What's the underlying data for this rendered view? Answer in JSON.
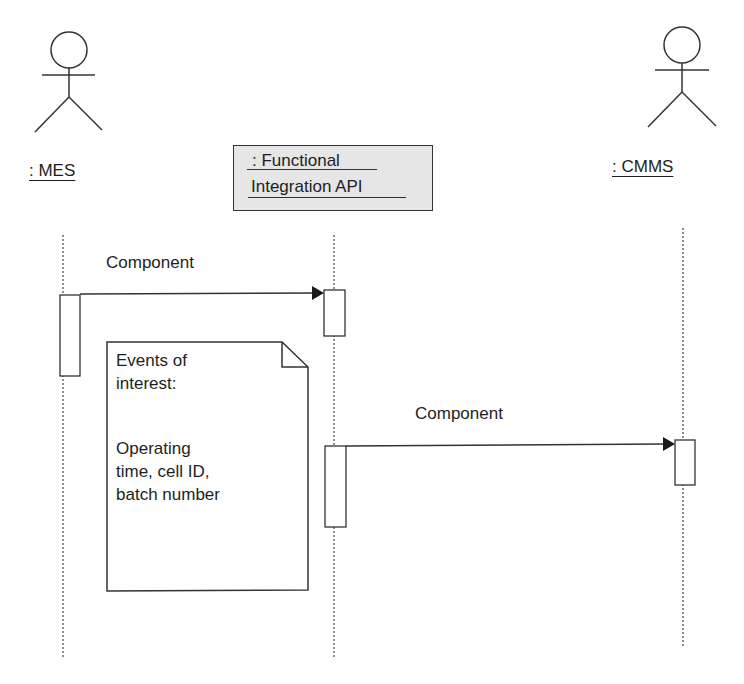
{
  "diagram": {
    "type": "UML sequence diagram",
    "participants": [
      {
        "id": "mes",
        "kind": "actor",
        "label": ": MES"
      },
      {
        "id": "api",
        "kind": "object",
        "label_line1": ": Functional",
        "label_line2": "Integration API"
      },
      {
        "id": "cmms",
        "kind": "actor",
        "label": ": CMMS"
      }
    ],
    "messages": [
      {
        "from": "mes",
        "to": "api",
        "label": "Component"
      },
      {
        "from": "api",
        "to": "cmms",
        "label": "Component"
      }
    ],
    "note": {
      "title_line1": "Events of",
      "title_line2": "interest:",
      "body_line1": "Operating",
      "body_line2": "time, cell ID,",
      "body_line3": "batch number"
    },
    "colors": {
      "line": "#333333",
      "object_fill": "#e6e6e6",
      "background": "#ffffff"
    }
  }
}
